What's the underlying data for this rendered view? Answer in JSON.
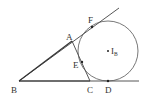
{
  "diagram": {
    "type": "geometry-excircle",
    "colors": {
      "stroke": "#444444",
      "label": "#333333",
      "background": "#ffffff"
    },
    "points": {
      "A": {
        "label": "A",
        "x": 72,
        "y": 41
      },
      "B": {
        "label": "B",
        "x": 19,
        "y": 81
      },
      "C": {
        "label": "C",
        "x": 90,
        "y": 81
      },
      "D": {
        "label": "D",
        "x": 108,
        "y": 81
      },
      "E": {
        "label": "E",
        "x": 82,
        "y": 62
      },
      "F": {
        "label": "F",
        "x": 92,
        "y": 27
      },
      "IB": {
        "label": "I",
        "subscript": "B",
        "x": 108,
        "y": 51
      }
    },
    "circle": {
      "center": "IB",
      "radius": 30
    },
    "labels": {
      "A": "A",
      "B": "B",
      "C": "C",
      "D": "D",
      "E": "E",
      "F": "F",
      "IB_main": "I",
      "IB_sub": "B"
    }
  }
}
